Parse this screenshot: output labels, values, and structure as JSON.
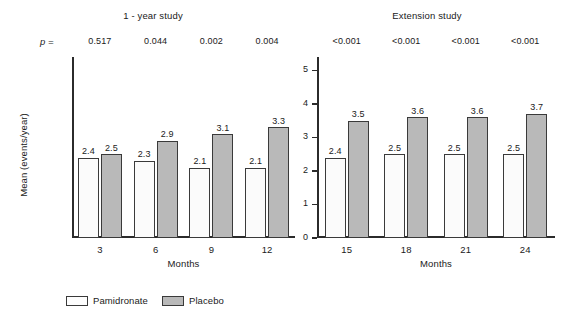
{
  "chart_data": {
    "type": "bar",
    "title": "",
    "ylabel": "Mean (events/year)",
    "ylim": [
      0,
      5.4
    ],
    "grid": false,
    "legend_position": "bottom-left",
    "series_names": [
      "Pamidronate",
      "Placebo"
    ],
    "panels": [
      {
        "name": "one-year-study",
        "title": "1 - year study",
        "xlabel": "Months",
        "categories": [
          "3",
          "6",
          "9",
          "12"
        ],
        "yticks": [],
        "ytick_labels": [],
        "pvalue_prefix": "p =",
        "pvalues": [
          "0.517",
          "0.044",
          "0.002",
          "0.004"
        ],
        "series": [
          {
            "name": "Pamidronate",
            "values": [
              2.4,
              2.3,
              2.1,
              2.1
            ],
            "labels": [
              "2.4",
              "2.3",
              "2.1",
              "2.1"
            ]
          },
          {
            "name": "Placebo",
            "values": [
              2.5,
              2.9,
              3.1,
              3.3
            ],
            "labels": [
              "2.5",
              "2.9",
              "3.1",
              "3.3"
            ]
          }
        ]
      },
      {
        "name": "extension-study",
        "title": "Extension study",
        "xlabel": "Months",
        "categories": [
          "15",
          "18",
          "21",
          "24"
        ],
        "yticks": [
          0,
          1,
          2,
          3,
          4,
          5
        ],
        "ytick_labels": [
          "0",
          "1",
          "2",
          "3",
          "4",
          "5"
        ],
        "pvalue_prefix": "",
        "pvalues": [
          "<0.001",
          "<0.001",
          "<0.001",
          "<0.001"
        ],
        "series": [
          {
            "name": "Pamidronate",
            "values": [
              2.4,
              2.5,
              2.5,
              2.5
            ],
            "labels": [
              "2.4",
              "2.5",
              "2.5",
              "2.5"
            ]
          },
          {
            "name": "Placebo",
            "values": [
              3.5,
              3.6,
              3.6,
              3.7
            ],
            "labels": [
              "3.5",
              "3.6",
              "3.6",
              "3.7"
            ]
          }
        ]
      }
    ]
  },
  "legend": {
    "items": [
      {
        "label": "Pamidronate",
        "swatch": "white-bar-swatch",
        "color": "#fdfdfd"
      },
      {
        "label": "Placebo",
        "swatch": "gray-bar-swatch",
        "color": "#b9b9b9"
      }
    ]
  },
  "colors": {
    "pamidronate": "#fdfdfd",
    "placebo": "#b9b9b9",
    "axis": "#2b2b2b",
    "text": "#1a1a1a",
    "background": "#ffffff"
  }
}
